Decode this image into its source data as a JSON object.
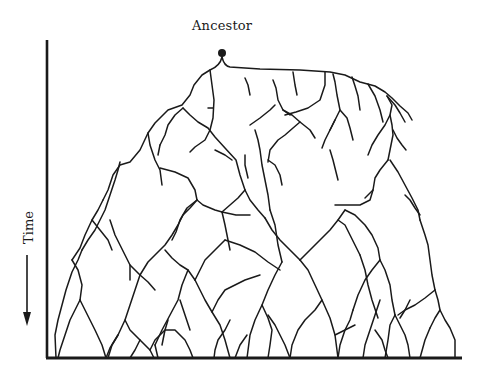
{
  "diagram": {
    "title": "Ancestor",
    "axis_label": "Time",
    "axis_direction": "down",
    "colors": {
      "ink": "#1a1a1a",
      "background": "#ffffff"
    },
    "ancestor_node": {
      "cx": 222,
      "cy": 53,
      "r": 4
    },
    "axes": {
      "vertical": {
        "x": 47,
        "y1": 40,
        "y2": 358
      },
      "horizontal": {
        "y": 358,
        "x1": 46,
        "x2": 462
      }
    },
    "time_arrow": {
      "x": 27,
      "y1": 255,
      "y2": 326
    },
    "branches": [
      "M222,57 Q224,66 230,67 L260,69 L300,70 L330,72 L345,75 L360,82 L375,86 L385,92 L392,98 L400,106 L408,113 L412,120",
      "M222,57 Q220,66 210,70 L202,75 L194,85 L190,95 L182,105 L168,110 L155,123 L148,133 L140,150 L130,162 L120,165 L113,175 L108,190 L103,200",
      "M210,70 L212,85 L214,100 L213,118 L210,130 L205,140 L195,147 L190,152",
      "M183,108 L190,115 L198,122 L208,128 L215,137 L225,148 L236,160 L240,175 L245,190",
      "M183,108 L175,115 L168,125 L165,135 L160,145",
      "M208,108 L213,108",
      "M148,133 L150,145 L155,160 L160,170 L162,185",
      "M160,168 L175,172 L188,178 L195,190 L197,200",
      "M245,78 L248,85 L250,95",
      "M273,80 L276,88 L278,100 L283,110 L290,115",
      "M275,105 L270,110 L260,118 L250,125",
      "M283,110 L292,115 L300,122 L310,130 L315,138",
      "M300,122 L293,128 L285,135 L278,140 L270,150 L268,162",
      "M293,72 L295,85 L297,95",
      "M325,72 L325,85 L320,100 L308,108 L296,112 L285,115",
      "M333,74 L335,82 L337,95 L340,110 L335,120 L330,130 L325,140 L322,148",
      "M340,110 L347,118 L350,128 L353,140",
      "M352,77 L355,86 L358,96 L360,110",
      "M368,84 L375,96 L380,110 L383,122",
      "M387,96 L392,105 L390,115 L385,125 L378,135 L372,145 L368,155",
      "M387,96 L395,105 L400,113 L405,122",
      "M390,115 L392,125 L393,135 L390,150 L388,160",
      "M393,130 L397,138 L402,145 L406,150",
      "M390,160 L398,172 L405,185 L412,198 L418,210 L420,220",
      "M405,195 L410,200 L415,208 L420,215",
      "M388,160 L380,170 L375,178 L373,190 L370,200 L360,205 L345,205 L335,205",
      "M373,190 L365,198",
      "M335,120 L330,130",
      "M330,150 L333,160 L336,172 L338,180",
      "M268,160 L275,165 L280,175 L282,185",
      "M255,130 L258,140 L260,150 L262,165 L265,180 L268,195 L270,210",
      "M245,190 L250,200 L258,210 L265,218",
      "M245,190 L238,198 L230,205 L222,212",
      "M197,200 L203,205 L215,210 L222,212 L236,215 L250,215",
      "M197,200 L190,208 L183,215 L178,225 L172,235 L165,245 L155,255 L148,262 L140,275",
      "M197,200 L187,208 L180,220 L176,232 L172,240",
      "M120,162 L118,170 L115,180 L110,195 L105,210 L100,220 L95,230 L88,240 L82,250",
      "M103,200 L98,210 L92,220 L85,235 L80,248 L72,260",
      "M82,250 L78,260 L72,272 L66,290 L62,305 L58,320 L55,335 L56,358",
      "M110,220 L115,235 L120,245 L125,255 L130,265 L130,280",
      "M92,220 L100,230 L108,240 L112,250",
      "M72,260 L78,270 L82,285 L80,300",
      "M80,300 L85,310 L90,320 L95,330 L102,345 L106,358",
      "M80,300 L75,310 L70,320 L65,335 L60,350 L58,358",
      "M130,265 L140,275 L148,282 L155,290",
      "M140,275 L135,290 L130,305 L125,320 L118,335 L110,348 L106,358",
      "M125,320 L130,330 L140,340 L150,350 L154,358",
      "M118,335 L112,345 L108,358",
      "M150,350 L155,340 L165,330 L175,330 L185,340 L190,350 L193,358",
      "M165,250 L172,258 L180,265 L188,270 L195,280",
      "M188,270 L182,285 L178,300 L170,315 L162,330 L155,345",
      "M195,280 L200,290 L205,300 L212,312 L220,325 L225,340 L230,358",
      "M212,312 L218,300 L225,290 L235,285 L245,280 L260,275",
      "M180,300 L185,315 L190,330",
      "M225,240 L215,250 L205,260 L200,270 L195,280",
      "M222,212 L225,225 L228,240 L230,250",
      "M225,240 L240,245 L255,252 L268,262 L280,270",
      "M265,218 L272,230 L280,240 L290,250 L300,260",
      "M270,210 L275,225 L278,245 L282,262",
      "M300,260 L308,270 L315,285 L322,300 L330,318 L335,335 L338,358",
      "M282,262 L275,275 L268,290 L262,305 L255,320 L250,335 L247,358",
      "M300,260 L310,250 L320,240 L330,230 L338,220 L345,210",
      "M338,220 L345,225 L350,235 L355,245 L360,255",
      "M322,300 L315,310 L305,320 L298,330 L292,345 L290,358",
      "M335,335 L345,330 L355,325",
      "M290,358 L285,345 L280,335 L275,325 L268,315",
      "M345,210 L355,215 L365,225 L372,235 L378,248 L380,260",
      "M380,260 L385,270 L390,285 L392,300 L395,315",
      "M380,260 L372,270 L365,280 L358,295 L353,310",
      "M395,315 L400,325 L405,335 L408,345 L410,358",
      "M395,315 L390,325 L388,340 L385,358",
      "M360,255 L365,270 L368,285 L372,300 L378,318",
      "M420,220 L425,235 L428,245 L430,260 L432,275 L435,290",
      "M435,290 L425,298 L415,305 L405,310 L398,315",
      "M435,290 L438,300 L440,310 L435,318 L430,328",
      "M440,310 L445,320 L450,328 L455,340 L455,358",
      "M430,328 L425,340 L420,358",
      "M410,300 L405,310 L400,318",
      "M380,300 L375,315 L370,330 L365,345 L363,358",
      "M353,310 L350,320 L345,330 L340,345 L338,358",
      "M155,345 L158,358",
      "M140,340 L135,350 L130,358",
      "M230,320 L225,330 L218,340 L215,350 L214,358",
      "M247,335 L240,345 L235,358",
      "M262,305 L268,318 L272,330 L270,345 L268,358",
      "M375,330 L382,340 L385,350 L388,358",
      "M168,320 L165,330 L162,345",
      "M245,155 L245,165 L248,178",
      "M160,145 L158,155",
      "M215,150 L225,155 L232,160"
    ]
  }
}
